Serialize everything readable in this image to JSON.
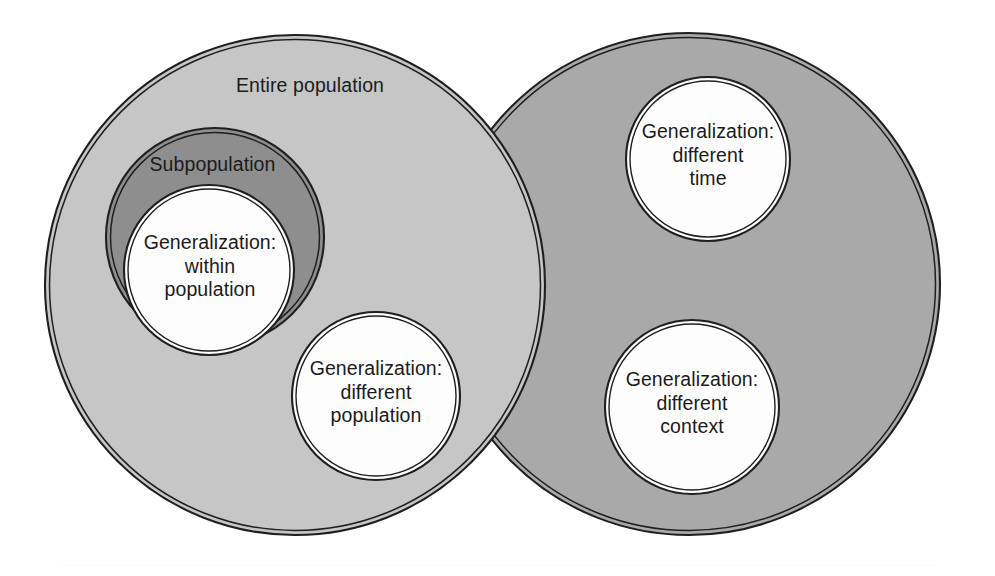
{
  "figure": {
    "kind": "venn-diagram",
    "title_text": "",
    "background_color": "#ffffff",
    "outline_color": "#1f1f1f",
    "text_color": "#1b1b1b"
  },
  "regions": {
    "entire_population": {
      "label": "Entire population",
      "fill_color": "#c6c6c6",
      "center_x": 295,
      "center_y": 285,
      "radius": 250
    },
    "different_settings": {
      "label": "",
      "fill_color": "#a9a9a9",
      "center_x": 689,
      "center_y": 284,
      "radius": 251
    },
    "subpopulation": {
      "label": "Subpopulation",
      "fill_color": "#8e8e8e",
      "center_x": 215,
      "center_y": 237,
      "radius": 109
    }
  },
  "generalization_circles": [
    {
      "id": "within-population",
      "label": "Generalization:\nwithin\npopulation",
      "fill_color": "#fdfdfd",
      "center_x": 209,
      "center_y": 270,
      "radius": 85
    },
    {
      "id": "different-population",
      "label": "Generalization:\ndifferent\npopulation",
      "fill_color": "#fdfdfd",
      "center_x": 376,
      "center_y": 396,
      "radius": 84
    },
    {
      "id": "different-time",
      "label": "Generalization:\ndifferent\ntime",
      "fill_color": "#fdfdfd",
      "center_x": 708,
      "center_y": 159,
      "radius": 82
    },
    {
      "id": "different-context",
      "label": "Generalization:\ndifferent\ncontext",
      "fill_color": "#fdfdfd",
      "center_x": 692,
      "center_y": 407,
      "radius": 87
    }
  ],
  "footer": {
    "rule_color": "#fbfbfb"
  }
}
